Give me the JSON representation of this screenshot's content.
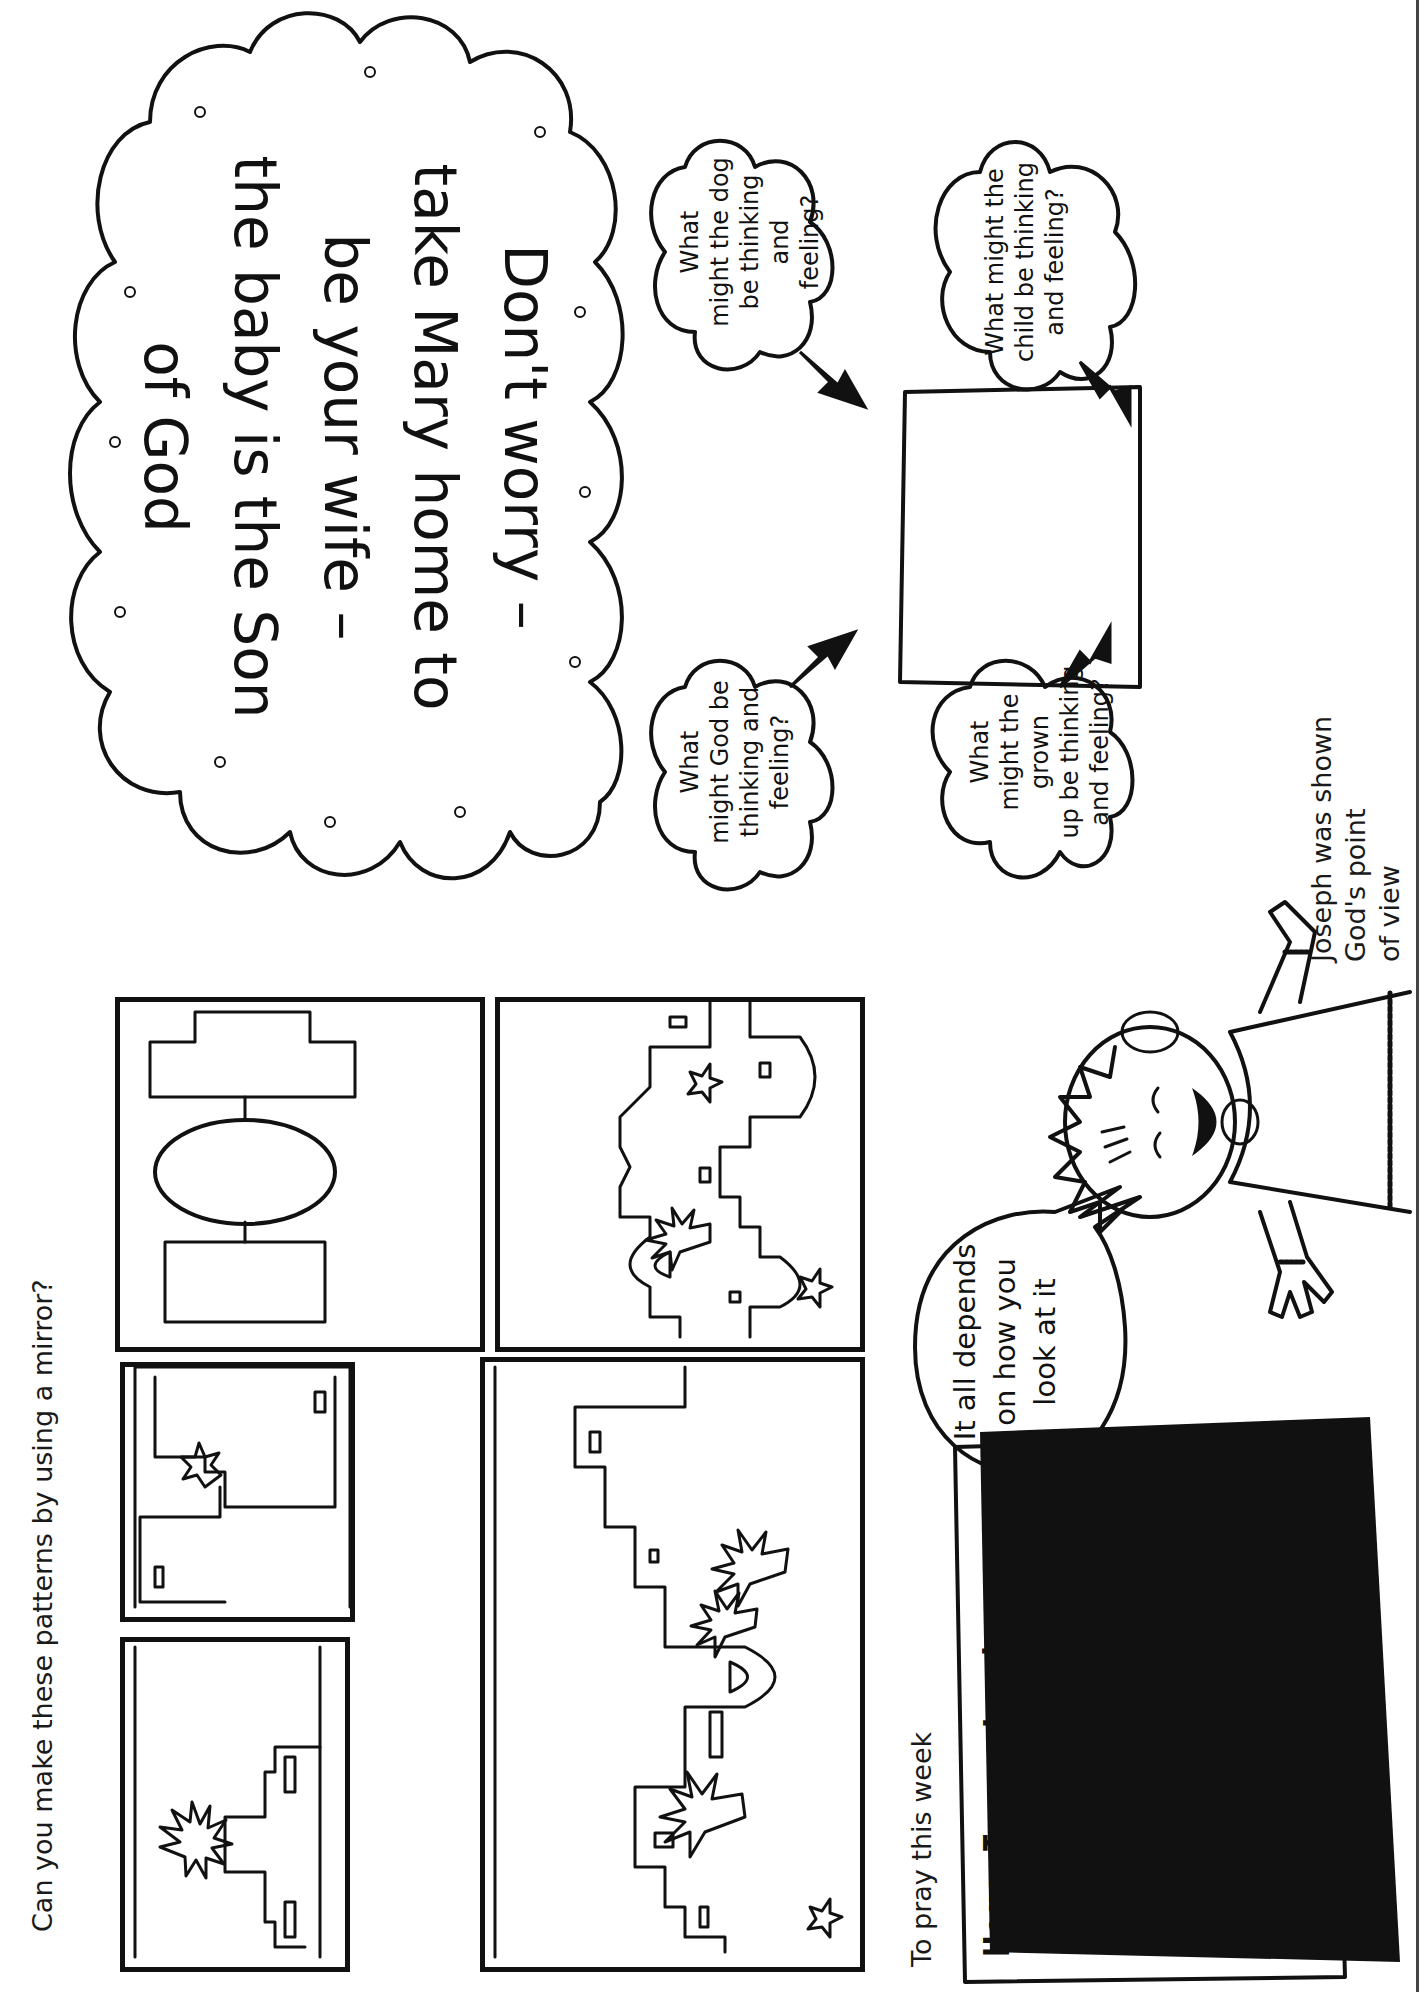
{
  "page": {
    "orientation": "rotated 90deg counterclockwise",
    "background": "#ffffff",
    "ink": "#111111"
  },
  "mirror_activity": {
    "heading": "Can you make these patterns by using a mirror?",
    "panels": [
      {
        "id": "panel-1",
        "content": "palm tree and building with two windows, half-pattern"
      },
      {
        "id": "panel-2",
        "content": "stepped buildings with star, half-pattern"
      },
      {
        "id": "panel-3",
        "content": "oval and two rectangles, half-pattern"
      },
      {
        "id": "panel-4",
        "content": "town skyline with three palm trees, arch and star"
      },
      {
        "id": "panel-5",
        "content": "town skyline with palm tree, arches and two stars"
      }
    ]
  },
  "joseph_section": {
    "caption_lines": [
      "Joseph was shown",
      "God's point",
      "of view"
    ],
    "mirror_message_lines": [
      "Don't worry –",
      "take Mary home to",
      "be your wife –",
      "the baby is the Son",
      "of God"
    ],
    "mirror_note": "text is printed mirror-reversed"
  },
  "viewpoints": {
    "center_box_label": "",
    "clouds": [
      {
        "id": "grown-up",
        "lines": [
          "What",
          "might the grown",
          "up be thinking",
          "and feeling?"
        ]
      },
      {
        "id": "child",
        "lines": [
          "What might the",
          "child be thinking",
          "and feeling?"
        ]
      },
      {
        "id": "god",
        "lines": [
          "What",
          "might God be",
          "thinking and",
          "feeling?"
        ]
      },
      {
        "id": "dog",
        "lines": [
          "What",
          "might the dog",
          "be thinking and",
          "feeling?"
        ]
      }
    ]
  },
  "character": {
    "speech_lines": [
      "It all depends",
      "on how you",
      "look at it"
    ]
  },
  "prayer": {
    "heading": "To pray this week",
    "lines": [
      "Here I am, Lord,",
      "ready to work with you",
      "however you like.",
      "Lead on  and",
      "I'll follow!   –Amen–"
    ]
  }
}
